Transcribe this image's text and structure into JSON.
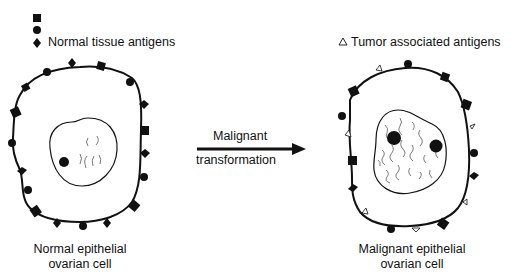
{
  "legend": {
    "normal": {
      "label": "Normal tissue antigens",
      "symbols": [
        "square",
        "circle",
        "diamond"
      ]
    },
    "tumor": {
      "label": "Tumor associated antigens",
      "symbol_glyph": "△"
    }
  },
  "transition": {
    "line1": "Malignant",
    "line2": "transformation"
  },
  "cells": {
    "normal": {
      "caption_line1": "Normal epithelial",
      "caption_line2": "ovarian cell"
    },
    "malignant": {
      "caption_line1": "Malignant epithelial",
      "caption_line2": "ovarian cell"
    }
  },
  "colors": {
    "ink": "#111111",
    "background": "#ffffff"
  }
}
